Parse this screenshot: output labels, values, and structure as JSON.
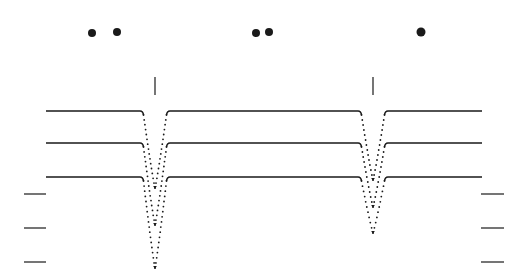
{
  "figure": {
    "width": 527,
    "height": 275,
    "background": "#ffffff",
    "ink": "#1a1a1a",
    "dots": [
      {
        "cx": 92,
        "cy": 33,
        "r": 4
      },
      {
        "cx": 117,
        "cy": 32,
        "r": 4
      },
      {
        "cx": 256,
        "cy": 33,
        "r": 4
      },
      {
        "cx": 269,
        "cy": 32,
        "r": 4
      },
      {
        "cx": 421,
        "cy": 32,
        "r": 4.5
      }
    ],
    "markers": [
      {
        "x": 155,
        "y1": 77,
        "y2": 95
      },
      {
        "x": 373,
        "y1": 77,
        "y2": 95
      }
    ],
    "traces": [
      {
        "baseline": 111,
        "dips": [
          {
            "x": 155,
            "bottom": 188,
            "hw": 12
          },
          {
            "x": 373,
            "bottom": 180,
            "hw": 12
          }
        ]
      },
      {
        "baseline": 143,
        "dips": [
          {
            "x": 155,
            "bottom": 225,
            "hw": 12
          },
          {
            "x": 373,
            "bottom": 207,
            "hw": 12
          }
        ]
      },
      {
        "baseline": 177,
        "dips": [
          {
            "x": 155,
            "bottom": 268,
            "hw": 12
          },
          {
            "x": 373,
            "bottom": 233,
            "hw": 12
          }
        ]
      }
    ],
    "trace_x_start": 46,
    "trace_x_end": 482,
    "left_ticks": [
      {
        "x1": 24,
        "x2": 46,
        "y": 194
      },
      {
        "x1": 24,
        "x2": 46,
        "y": 228
      },
      {
        "x1": 24,
        "x2": 46,
        "y": 262
      }
    ],
    "right_ticks": [
      {
        "x1": 481,
        "x2": 504,
        "y": 194
      },
      {
        "x1": 481,
        "x2": 504,
        "y": 228
      },
      {
        "x1": 481,
        "x2": 504,
        "y": 262
      }
    ]
  }
}
